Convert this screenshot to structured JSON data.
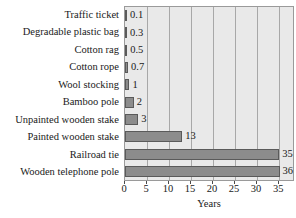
{
  "chart_data": {
    "type": "bar",
    "orientation": "horizontal",
    "title": "",
    "xlabel": "Years",
    "ylabel": "",
    "categories": [
      "Traffic ticket",
      "Degradable plastic bag",
      "Cotton rag",
      "Cotton rope",
      "Wool stocking",
      "Bamboo pole",
      "Unpainted wooden stake",
      "Painted wooden stake",
      "Railroad tie",
      "Wooden telephone pole"
    ],
    "values": [
      0.1,
      0.3,
      0.5,
      0.7,
      1,
      2,
      3,
      13,
      35,
      36
    ],
    "value_labels": [
      "0.1",
      "0.3",
      "0.5",
      "0.7",
      "1",
      "2",
      "3",
      "13",
      "35",
      "36"
    ],
    "xlim": [
      0,
      38.6
    ],
    "xticks": [
      0,
      5,
      10,
      15,
      20,
      25,
      30,
      35
    ],
    "xtick_labels": [
      "0",
      "5",
      "10",
      "15",
      "20",
      "25",
      "30",
      "35"
    ],
    "grid": "vertical",
    "legend": null,
    "colors": {
      "bar_fill": "#8c8c8c",
      "bar_border": "#5a5a5a",
      "plot_background": "#e9e9e9",
      "gridline": "#a8a8a8",
      "plot_border": "#9a9a9a",
      "text": "#1a1a1a",
      "page_background": "#ffffff"
    }
  }
}
